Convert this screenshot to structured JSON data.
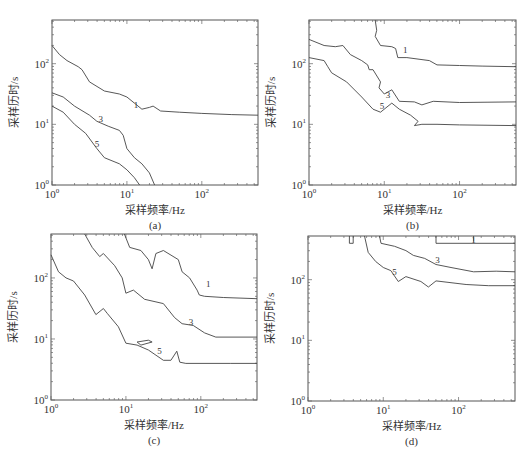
{
  "chart_data": [
    {
      "id": "a",
      "type": "line",
      "caption": "(a)",
      "xlabel": "采样频率/Hz",
      "ylabel": "采样历时/s",
      "xscale": "log",
      "yscale": "log",
      "xlim": [
        1,
        560
      ],
      "ylim": [
        1,
        530
      ],
      "xticks": [
        "10^0",
        "10^1",
        "10^2"
      ],
      "yticks": [
        "10^0",
        "10^1",
        "10^2"
      ],
      "series": [
        {
          "name": "1",
          "points_log10": [
            [
              0,
              2.3
            ],
            [
              0.1,
              2.15
            ],
            [
              0.2,
              2.05
            ],
            [
              0.35,
              1.95
            ],
            [
              0.4,
              1.9
            ],
            [
              0.5,
              1.7
            ],
            [
              0.7,
              1.55
            ],
            [
              0.9,
              1.5
            ],
            [
              1.0,
              1.45
            ],
            [
              1.1,
              1.35
            ],
            [
              1.2,
              1.25
            ],
            [
              1.3,
              1.28
            ],
            [
              1.35,
              1.3
            ],
            [
              1.45,
              1.22
            ],
            [
              1.7,
              1.2
            ],
            [
              2.0,
              1.18
            ],
            [
              2.4,
              1.16
            ],
            [
              2.75,
              1.15
            ]
          ],
          "label_at": [
            1.12,
            1.32
          ]
        },
        {
          "name": "3",
          "points_log10": [
            [
              0,
              1.52
            ],
            [
              0.15,
              1.45
            ],
            [
              0.3,
              1.3
            ],
            [
              0.5,
              1.15
            ],
            [
              0.6,
              1.05
            ],
            [
              0.75,
              0.97
            ],
            [
              0.9,
              0.9
            ],
            [
              0.95,
              0.82
            ],
            [
              1.0,
              0.6
            ],
            [
              1.1,
              0.45
            ],
            [
              1.2,
              0.35
            ],
            [
              1.3,
              0.2
            ],
            [
              1.37,
              0
            ]
          ],
          "label_at": [
            0.65,
            1.08
          ]
        },
        {
          "name": "5",
          "points_log10": [
            [
              0,
              1.3
            ],
            [
              0.15,
              1.2
            ],
            [
              0.3,
              1.0
            ],
            [
              0.45,
              0.85
            ],
            [
              0.6,
              0.6
            ],
            [
              0.7,
              0.45
            ],
            [
              0.9,
              0.35
            ],
            [
              1.0,
              0.25
            ],
            [
              1.1,
              0.12
            ],
            [
              1.17,
              0
            ]
          ],
          "label_at": [
            0.6,
            0.68
          ]
        }
      ]
    },
    {
      "id": "b",
      "type": "line",
      "caption": "(b)",
      "xlabel": "采样频率/Hz",
      "ylabel": "采样历时/s",
      "xscale": "log",
      "yscale": "log",
      "xlim": [
        1,
        560
      ],
      "ylim": [
        1,
        530
      ],
      "xticks": [
        "10^0",
        "10^1",
        "10^2"
      ],
      "yticks": [
        "10^0",
        "10^1",
        "10^2"
      ],
      "series": [
        {
          "name": "1",
          "points_log10": [
            [
              0.88,
              2.72
            ],
            [
              0.9,
              2.55
            ],
            [
              0.88,
              2.45
            ],
            [
              0.95,
              2.3
            ],
            [
              1.1,
              2.28
            ],
            [
              1.15,
              2.25
            ],
            [
              1.18,
              2.1
            ],
            [
              1.3,
              2.1
            ],
            [
              1.6,
              2.05
            ],
            [
              1.7,
              1.98
            ],
            [
              2.0,
              1.97
            ],
            [
              2.3,
              1.96
            ],
            [
              2.75,
              1.95
            ]
          ],
          "label_at": [
            1.28,
            2.23
          ]
        },
        {
          "name": "3",
          "points_log10": [
            [
              0,
              2.4
            ],
            [
              0.2,
              2.3
            ],
            [
              0.35,
              2.28
            ],
            [
              0.45,
              2.3
            ],
            [
              0.55,
              2.15
            ],
            [
              0.7,
              2.05
            ],
            [
              0.78,
              1.98
            ],
            [
              0.8,
              1.9
            ],
            [
              0.85,
              1.9
            ],
            [
              0.95,
              1.7
            ],
            [
              0.93,
              1.6
            ],
            [
              1.0,
              1.5
            ],
            [
              1.1,
              1.57
            ],
            [
              1.2,
              1.38
            ],
            [
              1.4,
              1.37
            ],
            [
              1.5,
              1.32
            ],
            [
              1.65,
              1.38
            ],
            [
              2.0,
              1.36
            ],
            [
              2.75,
              1.37
            ]
          ],
          "label_at": [
            1.05,
            1.48
          ]
        },
        {
          "name": "5",
          "points_log10": [
            [
              0,
              2.1
            ],
            [
              0.2,
              2.05
            ],
            [
              0.25,
              1.95
            ],
            [
              0.3,
              1.85
            ],
            [
              0.5,
              1.7
            ],
            [
              0.7,
              1.45
            ],
            [
              0.85,
              1.25
            ],
            [
              0.95,
              1.2
            ],
            [
              1.1,
              1.35
            ],
            [
              1.2,
              1.25
            ],
            [
              1.35,
              1.15
            ],
            [
              1.45,
              1.05
            ],
            [
              1.4,
              0.98
            ],
            [
              1.5,
              1.0
            ],
            [
              1.7,
              1.0
            ],
            [
              2.0,
              0.99
            ],
            [
              2.75,
              0.98
            ]
          ],
          "label_at": [
            0.97,
            1.3
          ]
        }
      ]
    },
    {
      "id": "c",
      "type": "line",
      "caption": "(c)",
      "xlabel": "采样频率/Hz",
      "ylabel": "采样历时/s",
      "xscale": "log",
      "yscale": "log",
      "xlim": [
        1,
        560
      ],
      "ylim": [
        1,
        530
      ],
      "xticks": [
        "10^0",
        "10^1",
        "10^2"
      ],
      "yticks": [
        "10^0",
        "10^1",
        "10^2"
      ],
      "series": [
        {
          "name": "1",
          "points_log10": [
            [
              0.98,
              2.72
            ],
            [
              1.05,
              2.5
            ],
            [
              1.2,
              2.45
            ],
            [
              1.3,
              2.3
            ],
            [
              1.35,
              2.15
            ],
            [
              1.4,
              2.4
            ],
            [
              1.5,
              2.45
            ],
            [
              1.7,
              2.3
            ],
            [
              1.75,
              2.1
            ],
            [
              1.85,
              2.0
            ],
            [
              1.95,
              1.8
            ],
            [
              1.98,
              1.72
            ],
            [
              2.05,
              1.7
            ],
            [
              2.3,
              1.68
            ],
            [
              2.75,
              1.66
            ]
          ],
          "label_at": [
            2.1,
            1.9
          ]
        },
        {
          "name": "3",
          "points_log10": [
            [
              0.45,
              2.72
            ],
            [
              0.55,
              2.5
            ],
            [
              0.65,
              2.35
            ],
            [
              0.7,
              2.4
            ],
            [
              0.85,
              2.2
            ],
            [
              0.95,
              2.0
            ],
            [
              1.0,
              1.75
            ],
            [
              1.1,
              1.8
            ],
            [
              1.25,
              1.65
            ],
            [
              1.5,
              1.58
            ],
            [
              1.65,
              1.35
            ],
            [
              1.75,
              1.25
            ],
            [
              1.9,
              1.22
            ],
            [
              2.05,
              1.1
            ],
            [
              2.2,
              1.03
            ],
            [
              2.75,
              1.03
            ]
          ],
          "label_at": [
            1.87,
            1.28
          ]
        },
        {
          "name": "5",
          "points_log10": [
            [
              0,
              2.38
            ],
            [
              0.1,
              2.1
            ],
            [
              0.2,
              2.0
            ],
            [
              0.3,
              1.95
            ],
            [
              0.45,
              1.72
            ],
            [
              0.6,
              1.4
            ],
            [
              0.7,
              1.5
            ],
            [
              0.75,
              1.42
            ],
            [
              0.9,
              1.2
            ],
            [
              1.0,
              0.93
            ],
            [
              1.15,
              0.9
            ],
            [
              1.3,
              0.82
            ],
            [
              1.5,
              0.65
            ],
            [
              1.6,
              0.65
            ],
            [
              1.68,
              0.8
            ],
            [
              1.72,
              0.62
            ],
            [
              1.8,
              0.6
            ],
            [
              2.4,
              0.6
            ],
            [
              2.75,
              0.6
            ]
          ],
          "label_at": [
            1.45,
            0.8
          ]
        },
        {
          "name": "5-island",
          "points_log10": [
            [
              1.15,
              0.95
            ],
            [
              1.3,
              0.98
            ],
            [
              1.35,
              0.95
            ],
            [
              1.2,
              0.9
            ],
            [
              1.15,
              0.95
            ]
          ]
        }
      ]
    },
    {
      "id": "d",
      "type": "line",
      "caption": "(d)",
      "xlabel": "采样频率/Hz",
      "ylabel": "采样历时/s",
      "xscale": "log",
      "yscale": "log",
      "xlim": [
        1,
        560
      ],
      "ylim": [
        1,
        530
      ],
      "xticks": [
        "10^0",
        "10^1",
        "10^2"
      ],
      "yticks": [
        "10^0",
        "10^1",
        "10^2"
      ],
      "series": [
        {
          "name": "1",
          "points_log10": [
            [
              1.7,
              2.72
            ],
            [
              1.7,
              2.6
            ],
            [
              2.75,
              2.6
            ]
          ],
          "label_at": [
            2.2,
            2.66
          ]
        },
        {
          "name": "1-marker",
          "points_log10": [
            [
              2.2,
              2.72
            ],
            [
              2.2,
              2.63
            ]
          ]
        },
        {
          "name": "3",
          "points_log10": [
            [
              0.95,
              2.72
            ],
            [
              0.97,
              2.6
            ],
            [
              1.15,
              2.55
            ],
            [
              1.3,
              2.48
            ],
            [
              1.4,
              2.4
            ],
            [
              1.55,
              2.35
            ],
            [
              1.7,
              2.25
            ],
            [
              1.9,
              2.2
            ],
            [
              2.2,
              2.13
            ],
            [
              2.5,
              2.14
            ],
            [
              2.75,
              2.13
            ]
          ],
          "label_at": [
            1.72,
            2.32
          ]
        },
        {
          "name": "5",
          "points_log10": [
            [
              0.75,
              2.72
            ],
            [
              0.8,
              2.45
            ],
            [
              0.9,
              2.3
            ],
            [
              1.0,
              2.2
            ],
            [
              1.1,
              2.15
            ],
            [
              1.2,
              1.97
            ],
            [
              1.3,
              2.05
            ],
            [
              1.5,
              1.97
            ],
            [
              1.6,
              1.88
            ],
            [
              1.7,
              1.98
            ],
            [
              1.9,
              1.95
            ],
            [
              2.1,
              1.92
            ],
            [
              2.4,
              1.9
            ],
            [
              2.75,
              1.9
            ]
          ],
          "label_at": [
            1.15,
            2.13
          ]
        },
        {
          "name": "small-loop",
          "points_log10": [
            [
              0.55,
              2.72
            ],
            [
              0.55,
              2.6
            ],
            [
              0.6,
              2.6
            ],
            [
              0.6,
              2.72
            ]
          ]
        }
      ]
    }
  ],
  "panels_layout": [
    {
      "id": "a",
      "left": 52,
      "top": 20,
      "width": 206,
      "height": 165,
      "caption_x": 100,
      "caption_y": 212
    },
    {
      "id": "b",
      "left": 309,
      "top": 20,
      "width": 207,
      "height": 165,
      "caption_x": 357,
      "caption_y": 212
    },
    {
      "id": "c",
      "left": 51,
      "top": 234,
      "width": 206,
      "height": 166,
      "caption_x": 99,
      "caption_y": 429
    },
    {
      "id": "d",
      "left": 308,
      "top": 236,
      "width": 207,
      "height": 165,
      "caption_x": 356,
      "caption_y": 429
    }
  ]
}
